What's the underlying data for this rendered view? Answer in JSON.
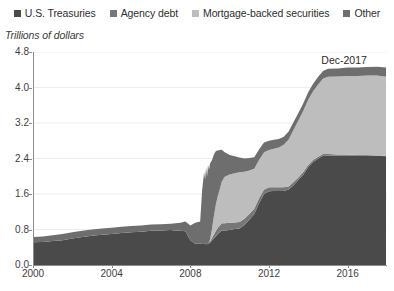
{
  "chart_data": {
    "type": "area",
    "stacked": true,
    "title": "",
    "subtitle": "",
    "xlabel": "",
    "ylabel": "Trillions of dollars",
    "grid": true,
    "grid_axis": "y",
    "legend_position": "top",
    "xlim": [
      2000,
      2018
    ],
    "ylim": [
      0.0,
      4.8
    ],
    "xticks": [
      2000,
      2004,
      2008,
      2012,
      2016
    ],
    "xticklabels": [
      "2000",
      "2004",
      "2008",
      "2012",
      "2016"
    ],
    "yticks": [
      0.0,
      0.8,
      1.6,
      2.4,
      3.2,
      4.0,
      4.8
    ],
    "yticklabels": [
      "0.0",
      "0.8",
      "1.6",
      "2.4",
      "3.2",
      "4.0",
      "4.8"
    ],
    "annotations": [
      {
        "text": "Dec-2017",
        "x": 2017.0,
        "y": 4.62
      }
    ],
    "colors": {
      "us_treasuries": "#4a4a4a",
      "agency_debt": "#777777",
      "mortgage_backed_securities": "#bdbdbd",
      "other": "#6e6e6e",
      "axis": "#8c8c8c",
      "gridline": "#ededed",
      "text": "#3d3d3d",
      "background": "#ffffff"
    },
    "x": [
      2000.0,
      2000.5,
      2001.0,
      2001.5,
      2002.0,
      2002.5,
      2003.0,
      2003.5,
      2004.0,
      2004.5,
      2005.0,
      2005.5,
      2006.0,
      2006.5,
      2007.0,
      2007.25,
      2007.5,
      2007.75,
      2008.0,
      2008.25,
      2008.5,
      2008.6,
      2008.7,
      2008.75,
      2008.8,
      2008.85,
      2008.9,
      2008.95,
      2009.0,
      2009.1,
      2009.2,
      2009.3,
      2009.4,
      2009.5,
      2009.6,
      2009.75,
      2010.0,
      2010.25,
      2010.5,
      2010.75,
      2011.0,
      2011.25,
      2011.5,
      2011.75,
      2012.0,
      2012.25,
      2012.5,
      2012.75,
      2013.0,
      2013.25,
      2013.5,
      2013.75,
      2014.0,
      2014.25,
      2014.5,
      2014.75,
      2015.0,
      2015.5,
      2016.0,
      2016.5,
      2017.0,
      2017.5,
      2017.95
    ],
    "series": [
      {
        "name": "U.S. Treasuries",
        "key": "us_treasuries",
        "color": "#4a4a4a",
        "values": [
          0.51,
          0.52,
          0.54,
          0.56,
          0.6,
          0.63,
          0.66,
          0.68,
          0.7,
          0.72,
          0.74,
          0.75,
          0.77,
          0.78,
          0.79,
          0.78,
          0.77,
          0.76,
          0.56,
          0.48,
          0.48,
          0.49,
          0.49,
          0.48,
          0.47,
          0.47,
          0.48,
          0.49,
          0.5,
          0.55,
          0.6,
          0.65,
          0.7,
          0.74,
          0.78,
          0.78,
          0.79,
          0.81,
          0.82,
          0.9,
          1.02,
          1.15,
          1.4,
          1.6,
          1.66,
          1.67,
          1.67,
          1.67,
          1.7,
          1.8,
          1.92,
          2.04,
          2.21,
          2.32,
          2.4,
          2.46,
          2.46,
          2.46,
          2.46,
          2.46,
          2.46,
          2.46,
          2.45
        ]
      },
      {
        "name": "Agency debt",
        "key": "agency_debt",
        "color": "#777777",
        "values": [
          0.0,
          0.0,
          0.0,
          0.0,
          0.0,
          0.0,
          0.0,
          0.0,
          0.0,
          0.0,
          0.0,
          0.0,
          0.0,
          0.0,
          0.0,
          0.0,
          0.0,
          0.0,
          0.0,
          0.0,
          0.0,
          0.0,
          0.0,
          0.0,
          0.0,
          0.0,
          0.0,
          0.02,
          0.03,
          0.06,
          0.09,
          0.12,
          0.14,
          0.15,
          0.16,
          0.16,
          0.16,
          0.15,
          0.15,
          0.14,
          0.13,
          0.12,
          0.11,
          0.1,
          0.09,
          0.08,
          0.08,
          0.08,
          0.07,
          0.07,
          0.06,
          0.06,
          0.05,
          0.05,
          0.04,
          0.04,
          0.04,
          0.03,
          0.03,
          0.02,
          0.02,
          0.01,
          0.01
        ]
      },
      {
        "name": "Mortgage-backed securities",
        "key": "mortgage_backed_securities",
        "color": "#bdbdbd",
        "values": [
          0.0,
          0.0,
          0.0,
          0.0,
          0.0,
          0.0,
          0.0,
          0.0,
          0.0,
          0.0,
          0.0,
          0.0,
          0.0,
          0.0,
          0.0,
          0.0,
          0.0,
          0.0,
          0.0,
          0.0,
          0.0,
          0.0,
          0.0,
          0.0,
          0.0,
          0.0,
          0.0,
          0.0,
          0.04,
          0.2,
          0.42,
          0.6,
          0.72,
          0.82,
          0.94,
          1.05,
          1.09,
          1.11,
          1.12,
          1.06,
          0.98,
          0.9,
          0.86,
          0.84,
          0.84,
          0.87,
          0.9,
          0.96,
          1.06,
          1.18,
          1.28,
          1.38,
          1.47,
          1.55,
          1.63,
          1.7,
          1.74,
          1.76,
          1.77,
          1.78,
          1.79,
          1.8,
          1.78
        ]
      },
      {
        "name": "Other",
        "key": "other",
        "color": "#6e6e6e",
        "values": [
          0.12,
          0.12,
          0.13,
          0.14,
          0.14,
          0.14,
          0.14,
          0.14,
          0.14,
          0.14,
          0.14,
          0.14,
          0.14,
          0.14,
          0.14,
          0.16,
          0.18,
          0.22,
          0.33,
          0.47,
          0.5,
          1.2,
          1.6,
          1.45,
          1.72,
          1.52,
          1.78,
          1.63,
          1.72,
          1.55,
          1.38,
          1.2,
          1.02,
          0.88,
          0.72,
          0.55,
          0.44,
          0.38,
          0.33,
          0.3,
          0.28,
          0.26,
          0.24,
          0.22,
          0.21,
          0.2,
          0.19,
          0.18,
          0.18,
          0.17,
          0.17,
          0.17,
          0.17,
          0.17,
          0.17,
          0.17,
          0.18,
          0.18,
          0.19,
          0.19,
          0.19,
          0.2,
          0.21
        ]
      }
    ]
  },
  "legend": {
    "items": [
      {
        "label": "U.S. Treasuries",
        "color": "#4a4a4a",
        "key": "us_treasuries"
      },
      {
        "label": "Agency debt",
        "color": "#777777",
        "key": "agency_debt"
      },
      {
        "label": "Mortgage-backed securities",
        "color": "#bdbdbd",
        "key": "mortgage_backed_securities"
      },
      {
        "label": "Other",
        "color": "#6e6e6e",
        "key": "other"
      }
    ]
  },
  "axis_caption": {
    "text": "Trillions of dollars"
  },
  "annotation": {
    "text": "Dec-2017"
  }
}
